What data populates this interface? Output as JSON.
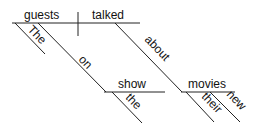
{
  "diagram": {
    "type": "sentence-diagram",
    "sentence": "The guests talked on the show about their new movies",
    "words": {
      "subject": "guests",
      "verb": "talked",
      "subject_modifier": "The",
      "preposition_1": "on",
      "object_1": "show",
      "object_1_modifier": "the",
      "preposition_2": "about",
      "object_2": "movies",
      "object_2_modifier_1": "their",
      "object_2_modifier_2": "new"
    }
  }
}
